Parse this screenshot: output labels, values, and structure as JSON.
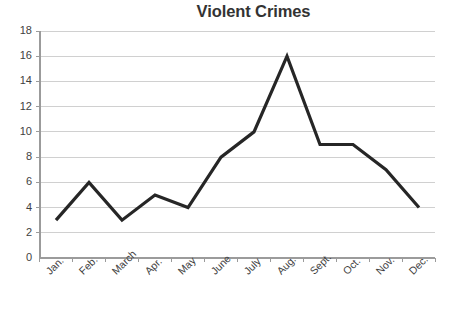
{
  "chart_data": {
    "type": "line",
    "title": "Violent Crimes",
    "xlabel": "",
    "ylabel": "",
    "categories": [
      "Jan.",
      "Feb.",
      "March",
      "Apr.",
      "May",
      "June",
      "July",
      "Aug.",
      "Sept.",
      "Oct.",
      "Nov.",
      "Dec."
    ],
    "values": [
      3,
      6,
      3,
      5,
      4,
      8,
      10,
      16,
      9,
      9,
      7,
      4
    ],
    "series": [
      {
        "name": "Violent Crimes",
        "values": [
          3,
          6,
          3,
          5,
          4,
          8,
          10,
          16,
          9,
          9,
          7,
          4
        ]
      }
    ],
    "ylim": [
      0,
      18
    ],
    "ytick_interval": 2,
    "ytick_labels": [
      "0",
      "2",
      "4",
      "6",
      "8",
      "10",
      "12",
      "14",
      "16",
      "18"
    ],
    "grid": "horizontal",
    "legend": "none",
    "markers": "none",
    "line_color": "#262626",
    "grid_color": "#d0d0d0",
    "axis_color": "#9b9b9b",
    "text_color": "#3f3f3f",
    "background": "#ffffff",
    "xtick_label_rotation": -45
  },
  "geometry": {
    "plot_left": 40,
    "plot_right": 435,
    "plot_top": 31,
    "plot_bottom": 258,
    "point_start_x": 56,
    "point_spacing_x": 33
  }
}
